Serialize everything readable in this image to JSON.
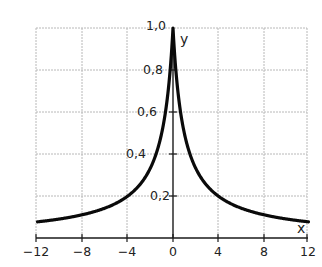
{
  "chart_data": {
    "type": "line",
    "title": "",
    "xlabel": "x",
    "ylabel": "y",
    "function": "y = 1/(1+|x|)",
    "xlim": [
      -12,
      12
    ],
    "ylim": [
      0,
      1.0
    ],
    "grid": true,
    "legend": null,
    "x_ticks": [
      -12,
      -8,
      -4,
      0,
      4,
      8,
      12
    ],
    "x_tick_labels": [
      "−12",
      "−8",
      "−4",
      "0",
      "4",
      "8",
      "12"
    ],
    "y_ticks": [
      0.2,
      0.4,
      0.6,
      0.8,
      1.0
    ],
    "y_tick_labels": [
      "0,2",
      "0,4",
      "0,6",
      "0,8",
      "1,0"
    ],
    "series": [
      {
        "name": "y",
        "x": [
          -12,
          -10,
          -8,
          -6,
          -4,
          -3,
          -2,
          -1,
          -0.5,
          0,
          0.5,
          1,
          2,
          3,
          4,
          6,
          8,
          10,
          12
        ],
        "values": [
          0.077,
          0.091,
          0.111,
          0.143,
          0.2,
          0.25,
          0.333,
          0.5,
          0.667,
          1.0,
          0.667,
          0.5,
          0.333,
          0.25,
          0.2,
          0.143,
          0.111,
          0.091,
          0.077
        ]
      }
    ]
  },
  "labels": {
    "x_axis": "x",
    "y_axis": "y",
    "x_ticks": [
      "−12",
      "−8",
      "−4",
      "0",
      "4",
      "8",
      "12"
    ],
    "y_ticks": [
      "0,2",
      "0,4",
      "0,6",
      "0,8",
      "1,0"
    ]
  },
  "colors": {
    "curve": "#0a0a0a",
    "grid": "#b8b8b8",
    "axis": "#1a1a1a"
  }
}
